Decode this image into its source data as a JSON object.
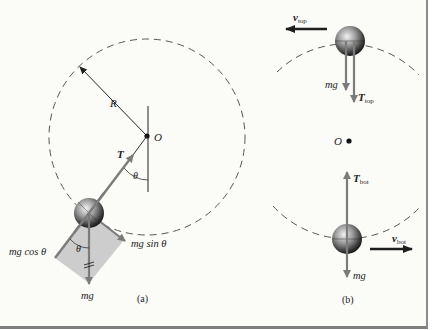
{
  "figure": {
    "panel_a": {
      "caption": "(a)",
      "radius_label": "R",
      "pivot_label": "O",
      "tension_label": "T",
      "angle_label_1": "θ",
      "angle_label_2": "θ",
      "weight_label": "mg",
      "radial_component_label": "mg cos θ",
      "tangential_component_label": "mg sin θ"
    },
    "panel_b": {
      "caption": "(b)",
      "pivot_label": "O",
      "top": {
        "velocity_symbol": "v",
        "velocity_subscript": "top",
        "weight_label": "mg",
        "tension_symbol": "T",
        "tension_subscript": "top"
      },
      "bottom": {
        "velocity_symbol": "v",
        "velocity_subscript": "bot",
        "weight_label": "mg",
        "tension_symbol": "T",
        "tension_subscript": "bot"
      }
    },
    "colors": {
      "background": "#fbfbf8",
      "force_arrow": "#7b7b7b",
      "velocity_arrow": "#1e1e1e",
      "component_box": "#c8c8c8",
      "dashed_path": "#555555",
      "frame_border": "#8c8c8c"
    }
  }
}
